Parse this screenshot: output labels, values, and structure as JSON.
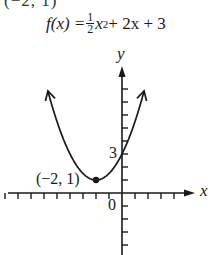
{
  "top_fragment": "(−2, 1)",
  "formula": {
    "lhs": "f(x) = ",
    "frac_num": "1",
    "frac_den": "2",
    "var": "x",
    "exp": "2",
    "rest": " + 2x + 3"
  },
  "axes": {
    "x_label": "x",
    "y_label": "y",
    "origin_label": "0",
    "y_intercept_label": "3"
  },
  "vertex": {
    "label": "(−2, 1)",
    "x": -2,
    "y": 1
  },
  "colors": {
    "ink": "#1a1a1a",
    "background": "#ffffff"
  },
  "chart_data": {
    "type": "line",
    "function": "0.5*x^2 + 2*x + 3",
    "xlabel": "x",
    "ylabel": "y",
    "x": [
      -5.7,
      -5,
      -4,
      -3,
      -2,
      -1,
      0,
      1,
      1.7
    ],
    "y": [
      7.8,
      5.5,
      3,
      1.5,
      1,
      1.5,
      3,
      5.5,
      7.8
    ],
    "points": [
      {
        "x": -2,
        "y": 1,
        "label": "(−2, 1)"
      },
      {
        "x": 0,
        "y": 3,
        "label": "3"
      }
    ],
    "xlim": [
      -9,
      5.5
    ],
    "ylim": [
      -4.8,
      9
    ],
    "x_ticks_left": 9,
    "x_ticks_right": 4,
    "y_ticks_up": 8,
    "y_ticks_down": 4,
    "grid": false
  }
}
